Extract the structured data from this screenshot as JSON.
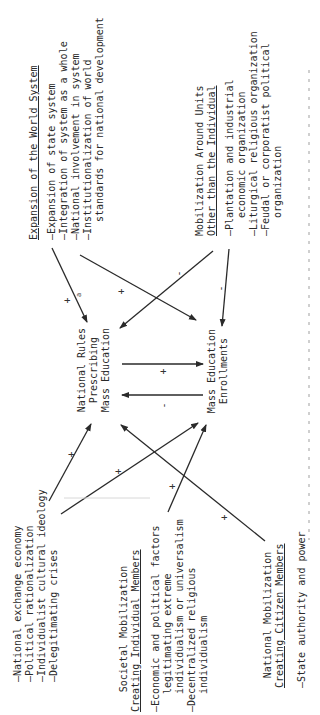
{
  "diagram": {
    "orientation": "rotated-90-ccw",
    "nodes": {
      "world_system": {
        "title": "Expansion of the World System",
        "items": [
          "—Expansion of state system",
          "—Integration of system as a whole",
          "—National involvement in system",
          "—Institutionalization of world",
          "   standards for national development"
        ]
      },
      "other_units": {
        "title_line1": "Mobilization Around Units",
        "title_line2": "Other than the Individual",
        "items": [
          "—Plantation and industrial",
          "   economic organization",
          "—Liturgical religious organization",
          "—Feudal or corporatist political",
          "   organization"
        ]
      },
      "national_rules": {
        "line1": "National Rules",
        "line2": "Prescribing",
        "line3": "Mass Education"
      },
      "enrollments": {
        "line1": "Mass Education",
        "line2": "Enrollments"
      },
      "exchange": {
        "items": [
          "—National exchange economy",
          "—Political rationalization",
          "—Individualist cultural ideology",
          "—Delegitimating crises"
        ]
      },
      "societal": {
        "title_line1": "Societal Mobilization",
        "title_line2": "Creating Individual Members",
        "items": [
          "—Economic and political factors",
          "   legitimating extreme",
          "   individualism or universalism",
          "—Decentralized religious",
          "   individualism"
        ]
      },
      "national_mobilization": {
        "title_line1": "National Mobilization",
        "title_line2": "Creating Citizen Members",
        "items": [
          "—State authority and power"
        ]
      }
    },
    "edges": [
      {
        "from": "world_system",
        "to": "national_rules",
        "sign": "+",
        "note": "a"
      },
      {
        "from": "world_system",
        "to": "enrollments",
        "sign": "+"
      },
      {
        "from": "other_units",
        "to": "national_rules",
        "sign": "-"
      },
      {
        "from": "other_units",
        "to": "enrollments",
        "sign": "-"
      },
      {
        "from": "national_rules",
        "to": "enrollments",
        "sign": "+"
      },
      {
        "from": "enrollments",
        "to": "national_rules",
        "sign": "-"
      },
      {
        "from": "exchange",
        "to": "national_rules",
        "sign": "+"
      },
      {
        "from": "exchange",
        "to": "enrollments",
        "sign": "+"
      },
      {
        "from": "societal",
        "to": "enrollments",
        "sign": "+"
      },
      {
        "from": "national_mobilization",
        "to": "national_rules",
        "sign": "+"
      }
    ],
    "signs": {
      "plus": "+",
      "minus": "-",
      "footnote": "a"
    },
    "colors": {
      "ink": "#2a2a2a",
      "background": "#ffffff"
    }
  }
}
